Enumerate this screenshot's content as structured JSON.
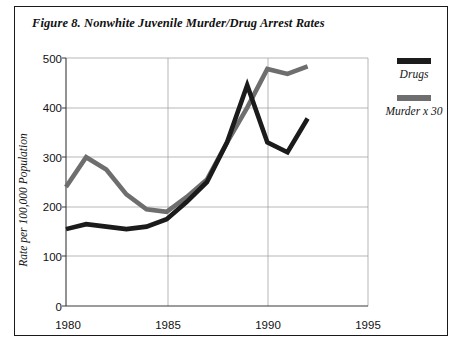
{
  "figure": {
    "title": "Figure 8. Nonwhite Juvenile Murder/Drug Arrest Rates"
  },
  "legend": {
    "position": "right",
    "entries": [
      {
        "label": "Drugs",
        "color": "#1b1b1b",
        "swatch_name": "legend-swatch-drugs"
      },
      {
        "label": "Murder x 30",
        "color": "#6e6e6e",
        "swatch_name": "legend-swatch-murder"
      }
    ]
  },
  "axes": {
    "ylabel": "Rate per 100,000 Population",
    "yticks": [
      "0",
      "100",
      "200",
      "300",
      "400",
      "500"
    ],
    "xticks": [
      "1980",
      "1985",
      "1990",
      "1995"
    ]
  },
  "chart_data": {
    "type": "line",
    "title": "Figure 8. Nonwhite Juvenile Murder/Drug Arrest Rates",
    "xlabel": "",
    "ylabel": "Rate per 100,000 Population",
    "xlim": [
      1980,
      1995
    ],
    "ylim": [
      0,
      500
    ],
    "xticks": [
      1980,
      1985,
      1990,
      1995
    ],
    "yticks": [
      0,
      100,
      200,
      300,
      400,
      500
    ],
    "grid": true,
    "legend_position": "right",
    "x": [
      1980,
      1981,
      1982,
      1983,
      1984,
      1985,
      1986,
      1987,
      1988,
      1989,
      1990,
      1991,
      1992
    ],
    "series": [
      {
        "name": "Drugs",
        "color": "#1b1b1b",
        "values": [
          155,
          165,
          160,
          155,
          160,
          175,
          210,
          250,
          330,
          445,
          330,
          310,
          378
        ]
      },
      {
        "name": "Murder x 30",
        "color": "#6e6e6e",
        "values": [
          240,
          300,
          275,
          225,
          195,
          190,
          220,
          255,
          330,
          400,
          478,
          468,
          483
        ]
      }
    ]
  }
}
